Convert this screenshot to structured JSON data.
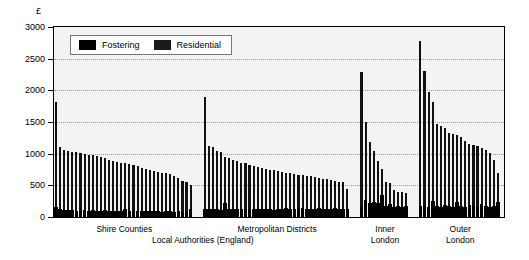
{
  "chart_data": {
    "type": "bar",
    "title": "",
    "subtitle": "",
    "xlabel": "Local Authorities (England)",
    "ylabel": "£",
    "ylim": [
      0,
      3000
    ],
    "yticks": [
      0,
      500,
      1000,
      1500,
      2000,
      2500,
      3000
    ],
    "ytick_labels": [
      "0",
      "500",
      "1000",
      "1500",
      "2000",
      "2500",
      "3000"
    ],
    "grid": "horizontal-dotted",
    "legend_position": "top-left-inside",
    "stacked": true,
    "legend": [
      {
        "label": "Fostering",
        "color": "#000000"
      },
      {
        "label": "Residential",
        "color": "#1a1a1a"
      }
    ],
    "series": [
      {
        "name": "Fostering",
        "color": "#000000"
      },
      {
        "name": "Residential",
        "color": "#1a1a1a"
      }
    ],
    "groups": [
      {
        "label": "Shire Counties",
        "bars": [
          {
            "residential": 1820,
            "fostering": 160
          },
          {
            "residential": 1100,
            "fostering": 120
          },
          {
            "residential": 1060,
            "fostering": 110
          },
          {
            "residential": 1040,
            "fostering": 105
          },
          {
            "residential": 1030,
            "fostering": 110
          },
          {
            "residential": 1020,
            "fostering": 100
          },
          {
            "residential": 1010,
            "fostering": 115
          },
          {
            "residential": 1000,
            "fostering": 105
          },
          {
            "residential": 985,
            "fostering": 100
          },
          {
            "residential": 975,
            "fostering": 110
          },
          {
            "residential": 960,
            "fostering": 100
          },
          {
            "residential": 940,
            "fostering": 95
          },
          {
            "residential": 925,
            "fostering": 105
          },
          {
            "residential": 905,
            "fostering": 100
          },
          {
            "residential": 890,
            "fostering": 95
          },
          {
            "residential": 875,
            "fostering": 100
          },
          {
            "residential": 860,
            "fostering": 95
          },
          {
            "residential": 845,
            "fostering": 130
          },
          {
            "residential": 830,
            "fostering": 95
          },
          {
            "residential": 815,
            "fostering": 90
          },
          {
            "residential": 800,
            "fostering": 100
          },
          {
            "residential": 780,
            "fostering": 95
          },
          {
            "residential": 765,
            "fostering": 90
          },
          {
            "residential": 750,
            "fostering": 95
          },
          {
            "residential": 730,
            "fostering": 90
          },
          {
            "residential": 715,
            "fostering": 95
          },
          {
            "residential": 700,
            "fostering": 85
          },
          {
            "residential": 690,
            "fostering": 95
          },
          {
            "residential": 675,
            "fostering": 90
          },
          {
            "residential": 640,
            "fostering": 85
          },
          {
            "residential": 610,
            "fostering": 90
          },
          {
            "residential": 575,
            "fostering": 85
          },
          {
            "residential": 545,
            "fostering": 80
          },
          {
            "residential": 500,
            "fostering": 130
          }
        ]
      },
      {
        "label": "Metropolitan Districts",
        "bars": [
          {
            "residential": 1890,
            "fostering": 120
          },
          {
            "residential": 1120,
            "fostering": 130
          },
          {
            "residential": 1105,
            "fostering": 125
          },
          {
            "residential": 1040,
            "fostering": 120
          },
          {
            "residential": 1020,
            "fostering": 115
          },
          {
            "residential": 940,
            "fostering": 215
          },
          {
            "residential": 935,
            "fostering": 120
          },
          {
            "residential": 900,
            "fostering": 130
          },
          {
            "residential": 880,
            "fostering": 125
          },
          {
            "residential": 860,
            "fostering": 120
          },
          {
            "residential": 845,
            "fostering": 130
          },
          {
            "residential": 820,
            "fostering": 115
          },
          {
            "residential": 805,
            "fostering": 125
          },
          {
            "residential": 790,
            "fostering": 120
          },
          {
            "residential": 775,
            "fostering": 130
          },
          {
            "residential": 760,
            "fostering": 120
          },
          {
            "residential": 750,
            "fostering": 125
          },
          {
            "residential": 735,
            "fostering": 115
          },
          {
            "residential": 725,
            "fostering": 130
          },
          {
            "residential": 715,
            "fostering": 120
          },
          {
            "residential": 700,
            "fostering": 140
          },
          {
            "residential": 690,
            "fostering": 125
          },
          {
            "residential": 680,
            "fostering": 130
          },
          {
            "residential": 670,
            "fostering": 120
          },
          {
            "residential": 660,
            "fostering": 135
          },
          {
            "residential": 650,
            "fostering": 125
          },
          {
            "residential": 640,
            "fostering": 130
          },
          {
            "residential": 630,
            "fostering": 120
          },
          {
            "residential": 620,
            "fostering": 135
          },
          {
            "residential": 605,
            "fostering": 125
          },
          {
            "residential": 595,
            "fostering": 130
          },
          {
            "residential": 585,
            "fostering": 120
          },
          {
            "residential": 575,
            "fostering": 135
          },
          {
            "residential": 560,
            "fostering": 125
          },
          {
            "residential": 545,
            "fostering": 130
          },
          {
            "residential": 450,
            "fostering": 120
          }
        ]
      },
      {
        "label": "Inner\nLondon",
        "bars": [
          {
            "residential": 2290,
            "fostering": 160
          },
          {
            "residential": 1500,
            "fostering": 270
          },
          {
            "residential": 1185,
            "fostering": 225
          },
          {
            "residential": 1050,
            "fostering": 235
          },
          {
            "residential": 880,
            "fostering": 215
          },
          {
            "residential": 760,
            "fostering": 340
          },
          {
            "residential": 560,
            "fostering": 180
          },
          {
            "residential": 530,
            "fostering": 210
          },
          {
            "residential": 430,
            "fostering": 165
          },
          {
            "residential": 400,
            "fostering": 180
          },
          {
            "residential": 390,
            "fostering": 155
          },
          {
            "residential": 380,
            "fostering": 170
          }
        ]
      },
      {
        "label": "Outer\nLondon",
        "bars": [
          {
            "residential": 2780,
            "fostering": 175
          },
          {
            "residential": 2310,
            "fostering": 190
          },
          {
            "residential": 1980,
            "fostering": 165
          },
          {
            "residential": 1810,
            "fostering": 250
          },
          {
            "residential": 1470,
            "fostering": 175
          },
          {
            "residential": 1430,
            "fostering": 165
          },
          {
            "residential": 1400,
            "fostering": 185
          },
          {
            "residential": 1325,
            "fostering": 170
          },
          {
            "residential": 1310,
            "fostering": 160
          },
          {
            "residential": 1290,
            "fostering": 230
          },
          {
            "residential": 1265,
            "fostering": 175
          },
          {
            "residential": 1200,
            "fostering": 165
          },
          {
            "residential": 1160,
            "fostering": 185
          },
          {
            "residential": 1140,
            "fostering": 170
          },
          {
            "residential": 1115,
            "fostering": 160
          },
          {
            "residential": 1090,
            "fostering": 200
          },
          {
            "residential": 1060,
            "fostering": 175
          },
          {
            "residential": 1010,
            "fostering": 165
          },
          {
            "residential": 900,
            "fostering": 180
          },
          {
            "residential": 700,
            "fostering": 230
          }
        ]
      }
    ]
  },
  "axis": {
    "currency_symbol": "£",
    "xlabel": "Local Authorities (England)"
  },
  "group_labels": {
    "shire": "Shire Counties",
    "metropolitan": "Metropolitan Districts",
    "inner_line1": "Inner",
    "inner_line2": "London",
    "outer_line1": "Outer",
    "outer_line2": "London"
  }
}
